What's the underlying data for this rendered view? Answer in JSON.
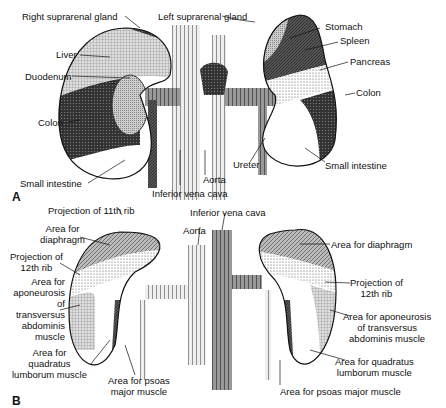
{
  "figure": {
    "panels": [
      {
        "id": "A",
        "letter": "A",
        "labels": {
          "right_suprarenal": "Right suprarenal gland",
          "left_suprarenal": "Left suprarenal gland",
          "liver": "Liver",
          "duodenum": "Duodenum",
          "colon_right": "Colon",
          "small_intestine_right": "Small intestine",
          "inferior_vena_cava": "Inferior vena cava",
          "aorta": "Aorta",
          "ureter": "Ureter",
          "stomach": "Stomach",
          "spleen": "Spleen",
          "pancreas": "Pancreas",
          "colon_left": "Colon",
          "small_intestine_left": "Small intestine"
        }
      },
      {
        "id": "B",
        "letter": "B",
        "labels": {
          "proj_11th_rib": "Projection of 11th rib",
          "diaphragm_left_1": "Area for",
          "diaphragm_left_2": "diaphragm",
          "proj_12th_left_1": "Projection of",
          "proj_12th_left_2": "12th rib",
          "apon_left_1": "Area for",
          "apon_left_2": "aponeurosis",
          "apon_left_3": "of",
          "apon_left_4": "transversus",
          "apon_left_5": "abdominis",
          "apon_left_6": "muscle",
          "quad_left_1": "Area for",
          "quad_left_2": "quadratus",
          "quad_left_3": "lumborum muscle",
          "psoas_left_1": "Area for psoas",
          "psoas_left_2": "major muscle",
          "aorta": "Aorta",
          "inferior_vena_cava": "Inferior vena cava",
          "diaphragm_right": "Area for diaphragm",
          "proj_12th_right_1": "Projection of",
          "proj_12th_right_2": "12th rib",
          "apon_right_1": "Area for aponeurosis",
          "apon_right_2": "of transversus",
          "apon_right_3": "abdominis muscle",
          "quad_right_1": "Area for quadratus",
          "quad_right_2": "lumborum muscle",
          "psoas_right": "Area for psoas major muscle"
        }
      }
    ]
  }
}
